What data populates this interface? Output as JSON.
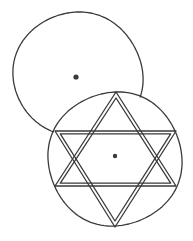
{
  "drawing": {
    "style": "hand-drawn pencil sketch",
    "background": "#ffffff",
    "ink_color": "#3a3a3a",
    "stroke_width": 1.3,
    "elements": [
      {
        "name": "upper-circle",
        "description": "Large open circle (partially hidden behind lower circle), with center dot",
        "center": [
          78,
          75
        ],
        "rx": 65,
        "ry": 62,
        "dot": [
          76,
          77
        ],
        "dot_radius": 2.6
      },
      {
        "name": "lower-circle",
        "description": "Circle with inscribed interlaced six-pointed star and center dot",
        "center": [
          115,
          159
        ],
        "radius": 67,
        "dot": [
          115,
          156
        ],
        "dot_radius": 2.2
      },
      {
        "name": "hexagram",
        "description": "Six-pointed star drawn with double lines, interlaced",
        "up_triangle": [
          [
            116,
            92
          ],
          [
            176,
            186
          ],
          [
            55,
            186
          ]
        ],
        "down_triangle": [
          [
            115,
            227
          ],
          [
            55,
            131
          ],
          [
            176,
            131
          ]
        ],
        "double_line_gap": 3
      }
    ]
  }
}
